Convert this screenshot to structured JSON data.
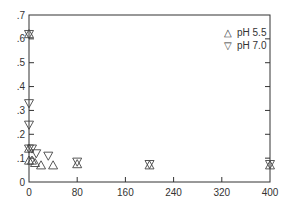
{
  "chart_data": {
    "type": "scatter",
    "title": "",
    "xlabel": "",
    "ylabel": "",
    "xlim": [
      0,
      400
    ],
    "ylim": [
      0,
      0.7
    ],
    "x_ticks": [
      0,
      80,
      160,
      240,
      320,
      400
    ],
    "x_tick_labels": [
      "0",
      "80",
      "160",
      "240",
      "320",
      "400"
    ],
    "y_ticks": [
      0,
      0.1,
      0.2,
      0.3,
      0.4,
      0.5,
      0.6,
      0.7
    ],
    "y_tick_labels": [
      "0",
      ".1",
      ".2",
      ".3",
      ".4",
      ".5",
      ".6",
      ".7"
    ],
    "grid": false,
    "legend_position": "upper right",
    "series": [
      {
        "name": "pH 5.5",
        "marker": "triangle-up",
        "x": [
          0,
          0,
          0,
          5,
          10,
          20,
          40,
          80,
          200,
          400
        ],
        "y": [
          0.62,
          0.14,
          0.09,
          0.09,
          0.08,
          0.07,
          0.07,
          0.075,
          0.07,
          0.07
        ]
      },
      {
        "name": "pH 7.0",
        "marker": "triangle-down",
        "x": [
          0,
          0,
          0,
          0,
          5,
          12,
          32,
          80,
          200,
          400
        ],
        "y": [
          0.62,
          0.33,
          0.24,
          0.14,
          0.14,
          0.12,
          0.11,
          0.085,
          0.075,
          0.075
        ]
      }
    ]
  },
  "legend": {
    "items": [
      {
        "label": "pH 5.5",
        "symbol": "△"
      },
      {
        "label": "pH 7.0",
        "symbol": "▽"
      }
    ]
  },
  "colors": {
    "axis": "#333333",
    "marker": "#444444",
    "background": "#ffffff"
  }
}
